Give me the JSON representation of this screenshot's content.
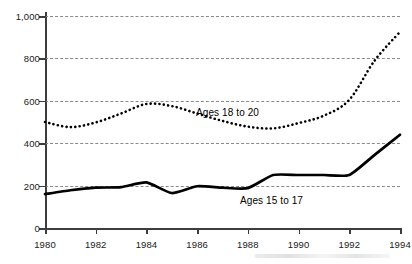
{
  "chart_data": {
    "type": "line",
    "title": "",
    "subtitle": "",
    "xlabel": "",
    "ylabel": "",
    "xlim": [
      1980,
      1994
    ],
    "ylim": [
      0,
      1000
    ],
    "grid": true,
    "grid_style": "dashed-horizontal",
    "legend_position": "inline-annotation",
    "x": [
      1980,
      1981,
      1982,
      1983,
      1984,
      1985,
      1986,
      1987,
      1988,
      1989,
      1990,
      1991,
      1992,
      1993,
      1994
    ],
    "y_ticks": [
      0,
      200,
      400,
      600,
      800,
      1000
    ],
    "y_tick_labels": [
      "0",
      "200",
      "400",
      "600",
      "800",
      "1,000"
    ],
    "x_ticks": [
      1980,
      1982,
      1984,
      1986,
      1988,
      1990,
      1992,
      1994
    ],
    "x_tick_labels": [
      "1980",
      "1982",
      "1984",
      "1986",
      "1988",
      "1990",
      "1992",
      "1994"
    ],
    "series": [
      {
        "name": "Ages 18 to 20",
        "style": "dotted",
        "color": "#000000",
        "values": [
          500,
          476,
          498,
          540,
          585,
          575,
          540,
          505,
          478,
          470,
          495,
          530,
          605,
          790,
          925
        ]
      },
      {
        "name": "Ages 15 to 17",
        "style": "solid",
        "color": "#000000",
        "values": [
          160,
          178,
          190,
          193,
          215,
          165,
          197,
          190,
          188,
          250,
          250,
          250,
          250,
          345,
          440
        ]
      }
    ],
    "annotations": [
      {
        "text": "Ages 18 to 20",
        "x": 1987.6,
        "y": 505
      },
      {
        "text": "Ages 15 to 17",
        "x": 1989.5,
        "y": 130
      }
    ]
  },
  "axis": {
    "y_labels": [
      "1,000",
      "800",
      "600",
      "400",
      "200",
      "0"
    ],
    "x_labels": [
      "1980",
      "1982",
      "1984",
      "1986",
      "1988",
      "1990",
      "1992",
      "1994"
    ]
  },
  "series_labels": {
    "upper": "Ages 18 to 20",
    "lower": "Ages 15 to 17"
  },
  "colors": {
    "series_ink": "#000000",
    "gridline": "#8a8a8a",
    "axis": "#3d3d3d",
    "background": "#ffffff"
  }
}
